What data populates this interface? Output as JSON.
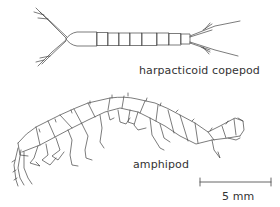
{
  "figure": {
    "specimens": [
      {
        "id": "copepod",
        "label": "harpacticoid copepod"
      },
      {
        "id": "amphipod",
        "label": "amphipod"
      }
    ],
    "scale_bar": {
      "label": "5 mm"
    },
    "colors": {
      "line": "#333333",
      "background": "#ffffff"
    }
  }
}
